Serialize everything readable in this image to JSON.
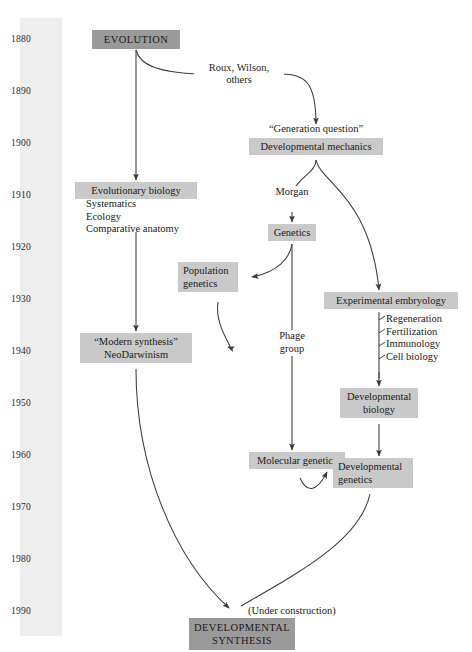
{
  "figure": {
    "type": "flowchart-timeline"
  },
  "timeline": {
    "name": "decade-axis",
    "years": [
      "1880",
      "1890",
      "1900",
      "1910",
      "1920",
      "1930",
      "1940",
      "1950",
      "1960",
      "1970",
      "1980",
      "1990"
    ]
  },
  "nodes": {
    "evolution": {
      "label": "EVOLUTION",
      "style": "boxed-dark"
    },
    "generation_q": {
      "label": "“Generation question”",
      "style": "plain"
    },
    "dev_mechanics": {
      "label": "Developmental mechanics",
      "style": "boxed"
    },
    "evo_biology": {
      "label": "Evolutionary biology",
      "style": "boxed"
    },
    "genetics": {
      "label": "Genetics",
      "style": "boxed"
    },
    "population_gen_1": {
      "label": "Population",
      "style": "boxed"
    },
    "population_gen_2": {
      "label": "genetics",
      "style": "boxed"
    },
    "exp_embryology": {
      "label": "Experimental embryology",
      "style": "boxed"
    },
    "modern_synth_1": {
      "label": "“Modern synthesis”",
      "style": "boxed"
    },
    "modern_synth_2": {
      "label": "NeoDarwinism",
      "style": "boxed"
    },
    "phage_group_1": {
      "label": "Phage",
      "style": "plain"
    },
    "phage_group_2": {
      "label": "group",
      "style": "plain"
    },
    "dev_biology_1": {
      "label": "Developmental",
      "style": "boxed"
    },
    "dev_biology_2": {
      "label": "biology",
      "style": "boxed"
    },
    "molecular_gen": {
      "label": "Molecular genetics",
      "style": "boxed"
    },
    "dev_genetics_1": {
      "label": "Developmental",
      "style": "boxed"
    },
    "dev_genetics_2": {
      "label": "genetics",
      "style": "boxed"
    },
    "dev_synthesis_1": {
      "label": "DEVELOPMENTAL",
      "style": "boxed-dark"
    },
    "dev_synthesis_2": {
      "label": "SYNTHESIS",
      "style": "boxed-dark"
    }
  },
  "sublists": {
    "evolutionary_biology_fields": [
      "Systematics",
      "Ecology",
      "Comparative anatomy"
    ],
    "experimental_embryology_fields": [
      "Regeneration",
      "Fertilization",
      "Immunology",
      "Cell biology"
    ]
  },
  "edge_labels": {
    "roux_wilson_line1": "Roux, Wilson,",
    "roux_wilson_line2": "others",
    "morgan": "Morgan",
    "under_construction": "(Under construction)"
  },
  "colors": {
    "box_light": "#c9c9c9",
    "box_dark": "#9a9a9a",
    "timeline_band": "#eeeeee",
    "edge_stroke": "#3a3a3a",
    "text": "#1a1a1a",
    "page_background": "#ffffff"
  }
}
